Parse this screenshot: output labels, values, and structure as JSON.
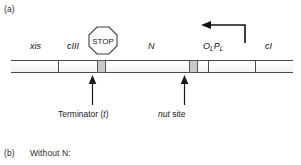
{
  "figure": {
    "panel_a": {
      "label": "(a)",
      "genome_map": {
        "genes": [
          {
            "name": "xis",
            "label": "xis"
          },
          {
            "name": "cIII",
            "label": "cIII"
          },
          {
            "name": "N",
            "label": "N"
          },
          {
            "name": "cI",
            "label": "cI"
          }
        ],
        "operator_promoter": {
          "operator_symbol": "O",
          "operator_subscript": "L",
          "promoter_symbol": "P",
          "promoter_subscript": "L",
          "full_label": "OL PL"
        },
        "stop_sign": {
          "text": "STOP",
          "shape": "octagon"
        },
        "transcription_arrow": {
          "direction": "leftward",
          "origin": "PL promoter"
        },
        "sites": [
          {
            "id": "terminator",
            "callout": "Terminator (t)",
            "callout_plain": "Terminator (",
            "callout_italic": "t",
            "callout_close": ")"
          },
          {
            "id": "nut",
            "callout": "nut site",
            "callout_italic": "nut",
            "callout_plain": " site"
          }
        ]
      }
    },
    "panel_b": {
      "label": "(b)",
      "caption": "Without N:"
    }
  },
  "colors": {
    "line": "#4a4a4a",
    "site_fill": "#c9c9c9",
    "site_stroke": "#555555",
    "text": "#1a1a1a",
    "arrow": "#111111"
  }
}
